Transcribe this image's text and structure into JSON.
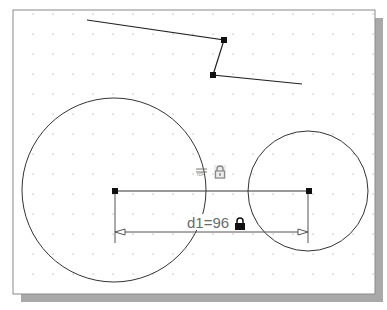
{
  "canvas": {
    "background": "#ffffff",
    "border_color": "#8a8a8a",
    "shadow_color": "#a9a9a9",
    "grid": {
      "dot_color": "#b5b5b5",
      "spacing": 20,
      "origin_x": 33,
      "origin_y": 14
    }
  },
  "sketch": {
    "polyline": {
      "points": [
        [
          87,
          20
        ],
        [
          224,
          40
        ],
        [
          213,
          75
        ],
        [
          302,
          84
        ]
      ],
      "stroke": "#222222"
    },
    "circles": [
      {
        "name": "large-circle",
        "cx": 114,
        "cy": 190,
        "r": 92
      },
      {
        "name": "small-circle",
        "cx": 308,
        "cy": 191,
        "r": 60
      }
    ],
    "center_line": {
      "x1": 115,
      "y1": 191,
      "x2": 309,
      "y2": 191
    }
  },
  "dimension": {
    "label": "d1=96",
    "name": "d1",
    "value": 96,
    "line_y": 232,
    "ext_bottom": 243
  },
  "constraints": {
    "horizontal_icon": "horizontal-constraint-icon",
    "lock_grey": "lock-icon",
    "lock_black": "lock-icon"
  }
}
